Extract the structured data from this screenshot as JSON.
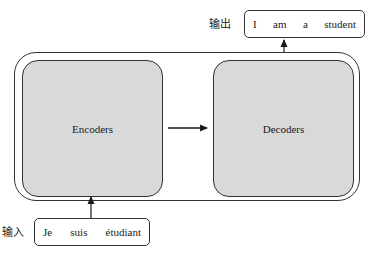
{
  "diagram": {
    "encoder_label": "Encoders",
    "decoder_label": "Decoders",
    "output": {
      "label": "输出",
      "tokens": [
        "I",
        "am",
        "a",
        "student"
      ]
    },
    "input": {
      "label": "输入",
      "tokens": [
        "Je",
        "suis",
        "étudiant"
      ]
    },
    "colors": {
      "block_fill": "#d9d9d9",
      "stroke": "#333333"
    }
  }
}
